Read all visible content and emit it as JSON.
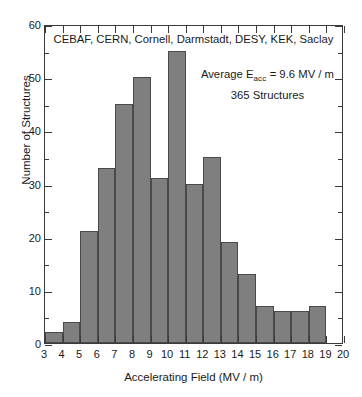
{
  "chart_data": {
    "type": "bar",
    "title": "CEBAF, CERN, Cornell, Darmstadt, DESY, KEK, Saclay",
    "xlabel": "Accelerating Field  (MV / m)",
    "ylabel": "Number of Structures",
    "xlim": [
      3,
      20
    ],
    "ylim": [
      0,
      60
    ],
    "grid": false,
    "legend": "none",
    "bin_width": 1,
    "bin_starts": [
      3,
      4,
      5,
      6,
      7,
      8,
      9,
      10,
      11,
      12,
      13,
      14,
      15,
      16,
      17,
      18
    ],
    "categories": [
      "3-4",
      "4-5",
      "5-6",
      "6-7",
      "7-8",
      "8-9",
      "9-10",
      "10-11",
      "11-12",
      "12-13",
      "13-14",
      "14-15",
      "15-16",
      "16-17",
      "17-18",
      "18-19"
    ],
    "values": [
      2,
      4,
      21,
      33,
      45,
      50,
      31,
      55,
      30,
      35,
      19,
      13,
      7,
      6,
      6,
      7
    ],
    "xticks": [
      3,
      4,
      5,
      6,
      7,
      8,
      9,
      10,
      11,
      12,
      13,
      14,
      15,
      16,
      17,
      18,
      19,
      20
    ],
    "yticks": [
      0,
      10,
      20,
      30,
      40,
      50,
      60
    ],
    "yticks_minor": [
      5,
      15,
      25,
      35,
      45,
      55
    ],
    "bar_color": "#7f7f7f",
    "bar_edge_color": "#4a4a4a",
    "axis_color": "#3a3a3a",
    "annotations": {
      "average_prefix": "Average  E",
      "average_subscript": "acc",
      "average_value": " = 9.6 MV / m",
      "count_line": "365  Structures"
    }
  }
}
